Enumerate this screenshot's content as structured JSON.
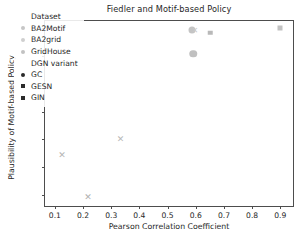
{
  "chart_data": {
    "type": "scatter",
    "title": "Fiedler and Motif-based Policy",
    "xlabel": "Pearson Correlation Coefficient",
    "ylabel": "Plausibility of Motif-based Policy",
    "xlim": [
      0.065,
      0.945
    ],
    "ylim": [
      0.6805,
      1.0125
    ],
    "xticks": [
      0.1,
      0.2,
      0.3,
      0.4,
      0.5,
      0.6,
      0.7,
      0.8,
      0.9
    ],
    "xtick_labels": [
      "0.1",
      "0.2",
      "0.3",
      "0.4",
      "0.5",
      "0.6",
      "0.7",
      "0.8",
      "0.9"
    ],
    "yticks": [
      0.7,
      0.75,
      0.8,
      0.85,
      0.9,
      0.95,
      1.0
    ],
    "ytick_labels": [
      "0.70",
      "0.75",
      "0.80",
      "0.85",
      "0.90",
      "0.95",
      "1.00"
    ],
    "grid": false,
    "legend_position": "upper left",
    "points": [
      {
        "x": 0.125,
        "y": 0.772,
        "marker": "x",
        "size": 9,
        "color": "#b4b4b4",
        "dataset": "GridHouse",
        "variant": "GIN"
      },
      {
        "x": 0.218,
        "y": 0.697,
        "marker": "x",
        "size": 9,
        "color": "#b0b0b0",
        "dataset": "GridHouse",
        "variant": "GIN"
      },
      {
        "x": 0.333,
        "y": 0.8,
        "marker": "x",
        "size": 9,
        "color": "#b8b8b8",
        "dataset": "GridHouse",
        "variant": "GIN"
      },
      {
        "x": 0.588,
        "y": 0.996,
        "marker": "circle",
        "size": 7,
        "color": "#c4c4c4",
        "dataset": "BA2Motif",
        "variant": "GC"
      },
      {
        "x": 0.597,
        "y": 0.994,
        "marker": "x",
        "size": 8,
        "color": "#c9c9c9",
        "dataset": "BA2Motif",
        "variant": "GIN"
      },
      {
        "x": 0.591,
        "y": 0.954,
        "marker": "circle",
        "size": 7.5,
        "color": "#c0c0c0",
        "dataset": "BA2Motif",
        "variant": "GC"
      },
      {
        "x": 0.651,
        "y": 0.991,
        "marker": "square",
        "size": 4.5,
        "color": "#b9b9b9",
        "dataset": "BA2grid",
        "variant": "GESN"
      },
      {
        "x": 0.899,
        "y": 1.0,
        "marker": "square",
        "size": 5,
        "color": "#c2c2c2",
        "dataset": "BA2grid",
        "variant": "GESN"
      }
    ],
    "legend": {
      "groups": [
        {
          "header": "Dataset",
          "entries": [
            {
              "label": "BA2Motif",
              "marker": "circle",
              "color": "#c6c6c6"
            },
            {
              "label": "BA2grid",
              "marker": "circle",
              "color": "#cfcfcf"
            },
            {
              "label": "GridHouse",
              "marker": "circle",
              "color": "#c2c2c2"
            }
          ]
        },
        {
          "header": "DGN variant",
          "entries": [
            {
              "label": "GC",
              "marker": "circle",
              "color": "#2b2b2b"
            },
            {
              "label": "GESN",
              "marker": "square",
              "color": "#2b2b2b"
            },
            {
              "label": "GIN",
              "marker": "square",
              "color": "#2b2b2b"
            }
          ]
        }
      ]
    }
  }
}
